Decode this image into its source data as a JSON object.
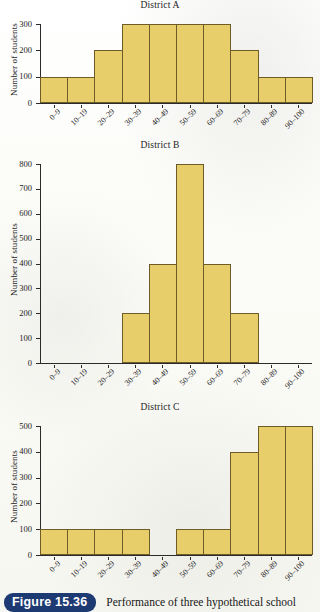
{
  "figure": {
    "badge_label": "Figure 15.36",
    "caption": "Performance of three hypothetical school",
    "badge_color": "#1d3a72",
    "bar_fill_color": "#e8cd6b",
    "bar_edge_color": "#6d5c27",
    "page_background": "#fdfdfa"
  },
  "common": {
    "ylabel": "Number of students",
    "categories": [
      "0–9",
      "10–19",
      "20–29",
      "30–39",
      "40–49",
      "50–59",
      "60–69",
      "70–79",
      "80–89",
      "90–100"
    ]
  },
  "chart_data": [
    {
      "type": "bar",
      "title": "District A",
      "xlabel": "",
      "ylabel": "Number of students",
      "categories": [
        "0–9",
        "10–19",
        "20–29",
        "30–39",
        "40–49",
        "50–59",
        "60–69",
        "70–79",
        "80–89",
        "90–100"
      ],
      "values": [
        100,
        100,
        200,
        300,
        300,
        300,
        300,
        200,
        100,
        100
      ],
      "yticks": [
        0,
        100,
        200,
        300
      ],
      "ylim": [
        0,
        300
      ],
      "grid": false,
      "legend": "none"
    },
    {
      "type": "bar",
      "title": "District B",
      "xlabel": "",
      "ylabel": "Number of students",
      "categories": [
        "0–9",
        "10–19",
        "20–29",
        "30–39",
        "40–49",
        "50–59",
        "60–69",
        "70–79",
        "80–89",
        "90–100"
      ],
      "values": [
        0,
        0,
        0,
        200,
        400,
        800,
        400,
        200,
        0,
        0
      ],
      "yticks": [
        0,
        100,
        200,
        300,
        400,
        500,
        600,
        700,
        800
      ],
      "ylim": [
        0,
        800
      ],
      "grid": false,
      "legend": "none"
    },
    {
      "type": "bar",
      "title": "District C",
      "xlabel": "",
      "ylabel": "Number of students",
      "categories": [
        "0–9",
        "10–19",
        "20–29",
        "30–39",
        "40–49",
        "50–59",
        "60–69",
        "70–79",
        "80–89",
        "90–100"
      ],
      "values": [
        100,
        100,
        100,
        100,
        0,
        100,
        100,
        400,
        500,
        500
      ],
      "yticks": [
        0,
        100,
        200,
        300,
        400,
        500
      ],
      "ylim": [
        0,
        500
      ],
      "grid": false,
      "legend": "none"
    }
  ]
}
